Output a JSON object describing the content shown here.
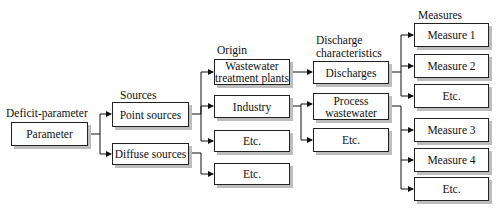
{
  "column_headers": {
    "deficit": "Deficit-parameter",
    "sources": "Sources",
    "origin": "Origin",
    "discharge_line1": "Discharge",
    "discharge_line2": "characteristics",
    "measures": "Measures"
  },
  "nodes": {
    "parameter": "Parameter",
    "point_sources": "Point sources",
    "diffuse_sources": "Diffuse sources",
    "wwtp_line1": "Wastewater",
    "wwtp_line2": "treatment plants",
    "industry": "Industry",
    "origin_etc_point": "Etc.",
    "origin_etc_diffuse": "Etc.",
    "discharges": "Discharges",
    "process_line1": "Process",
    "process_line2": "wastewater",
    "discharge_etc": "Etc.",
    "measure_1": "Measure 1",
    "measure_2": "Measure 2",
    "measure_etc_a": "Etc.",
    "measure_3": "Measure 3",
    "measure_4": "Measure 4",
    "measure_etc_b": "Etc."
  },
  "edges": [
    [
      "parameter",
      "point_sources"
    ],
    [
      "parameter",
      "diffuse_sources"
    ],
    [
      "point_sources",
      "wwtp"
    ],
    [
      "point_sources",
      "industry"
    ],
    [
      "point_sources",
      "origin_etc_point"
    ],
    [
      "diffuse_sources",
      "origin_etc_diffuse"
    ],
    [
      "wwtp",
      "discharges"
    ],
    [
      "industry",
      "process_wastewater"
    ],
    [
      "industry",
      "discharge_etc"
    ],
    [
      "discharges",
      "measure_1"
    ],
    [
      "discharges",
      "measure_2"
    ],
    [
      "discharges",
      "measure_etc_a"
    ],
    [
      "process_wastewater",
      "measure_3"
    ],
    [
      "process_wastewater",
      "measure_4"
    ],
    [
      "process_wastewater",
      "measure_etc_b"
    ]
  ]
}
